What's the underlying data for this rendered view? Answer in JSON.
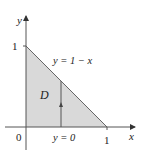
{
  "diagram": {
    "type": "region-of-integration",
    "region_label": "D",
    "region_fill": "#d9d9d9",
    "axis_color": "#555555",
    "boundary_color": "#666666",
    "axes": {
      "x_label": "x",
      "y_label": "y",
      "origin_label": "0",
      "x_tick_label": "1",
      "y_tick_label": "1"
    },
    "curves": {
      "upper": "y = 1 − x",
      "lower": "y = 0"
    },
    "vertices": [
      [
        0,
        0
      ],
      [
        1,
        0
      ],
      [
        0,
        1
      ]
    ],
    "arrow": "vertical strip from y = 0 to y = 1 − x"
  }
}
